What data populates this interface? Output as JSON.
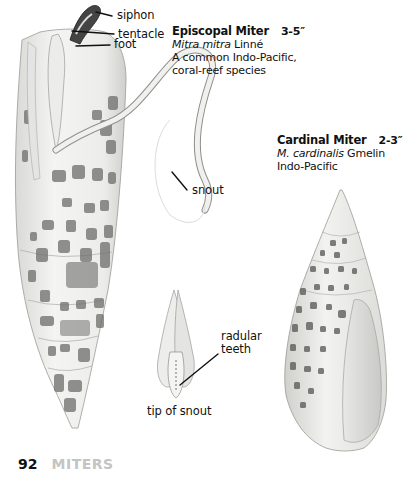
{
  "page": {
    "number": "92",
    "section": "MITERS"
  },
  "species": [
    {
      "common_name": "Episcopal Miter",
      "size": "3-5″",
      "scientific_italic": "Mitra mitra",
      "scientific_author": " Linné",
      "description_lines": [
        "A common Indo-Pacific,",
        "coral-reef species"
      ]
    },
    {
      "common_name": "Cardinal Miter",
      "size": "2-3″",
      "scientific_prefix": "M. ",
      "scientific_italic": "cardinalis",
      "scientific_author": " Gmelin",
      "description_lines": [
        "Indo-Pacific"
      ]
    }
  ],
  "anatomy_labels": {
    "siphon": "siphon",
    "tentacle": "tentacle",
    "foot": "foot",
    "snout": "snout",
    "radular_teeth_line1": "radular",
    "radular_teeth_line2": "teeth",
    "tip_of_snout": "tip of snout"
  },
  "colors": {
    "text": "#111111",
    "section_gray": "#c4c4c4",
    "shell_base": "#f2f2f0",
    "shell_spot": "#6a6a6a"
  }
}
